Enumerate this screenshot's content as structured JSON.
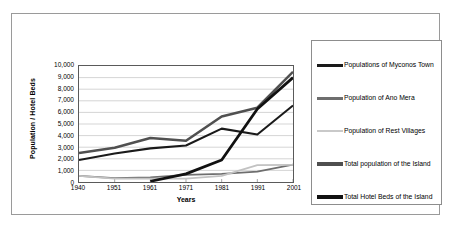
{
  "chart_data": {
    "type": "line",
    "title": "",
    "xlabel": "Years",
    "ylabel": "Population / Hotel Beds",
    "categories": [
      "1940",
      "1951",
      "1961",
      "1971",
      "1981",
      "1991",
      "2001"
    ],
    "xlim": [
      "1940",
      "2001"
    ],
    "ylim": [
      0,
      10000
    ],
    "ytick_labels": [
      "10,000",
      "9,000",
      "8,000",
      "7,000",
      "6,000",
      "5,000",
      "4,000",
      "3,000",
      "2,000",
      "1,000",
      "0"
    ],
    "ytick_values": [
      10000,
      9000,
      8000,
      7000,
      6000,
      5000,
      4000,
      3000,
      2000,
      1000,
      0
    ],
    "grid": "horizontal",
    "legend_position": "right",
    "series": [
      {
        "name": "Populations of Myconos Town",
        "color": "#1a1a1a",
        "width": 2.1,
        "values": [
          1900,
          2450,
          2900,
          3150,
          4600,
          4100,
          6600
        ]
      },
      {
        "name": "Population of Ano Mera",
        "color": "#6e6e6e",
        "width": 1.8,
        "values": [
          520,
          330,
          400,
          620,
          700,
          900,
          1500
        ]
      },
      {
        "name": "Population of Rest Villages",
        "color": "#c2c2c2",
        "width": 1.8,
        "values": [
          520,
          300,
          290,
          300,
          520,
          1450,
          1480
        ]
      },
      {
        "name": "Total population of the Island",
        "color": "#505050",
        "width": 2.6,
        "values": [
          2500,
          2950,
          3800,
          3550,
          5650,
          6400,
          9500
        ]
      },
      {
        "name": "Total Hotel Beds of the Island",
        "color": "#111111",
        "width": 2.8,
        "values": [
          null,
          null,
          60,
          700,
          1900,
          6300,
          9000
        ]
      }
    ]
  },
  "legend": {
    "items": [
      {
        "label": "Populations of Myconos Town",
        "color": "#1a1a1a",
        "thickness": 3
      },
      {
        "label": "Population of Ano Mera",
        "color": "#6e6e6e",
        "thickness": 3
      },
      {
        "label": "Population of Rest Villages",
        "color": "#c9c9c9",
        "thickness": 2
      },
      {
        "label": "Total population of the Island",
        "color": "#4f4f4f",
        "thickness": 4
      },
      {
        "label": "Total Hotel Beds of the Island",
        "color": "#111111",
        "thickness": 4
      }
    ]
  }
}
